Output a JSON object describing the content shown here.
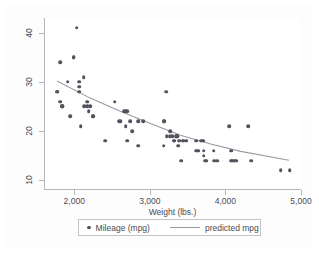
{
  "chart_data": {
    "type": "scatter",
    "title": "",
    "xlabel": "Weight (lbs.)",
    "ylabel": "",
    "xlim": [
      1600,
      5000
    ],
    "ylim": [
      8,
      43
    ],
    "xticks": [
      2000,
      3000,
      4000,
      5000
    ],
    "xticklabels": [
      "2,000",
      "3,000",
      "4,000",
      "5,000"
    ],
    "yticks": [
      10,
      20,
      30,
      40
    ],
    "yticklabels": [
      "10",
      "20",
      "30",
      "40"
    ],
    "grid": false,
    "legend_position": "below-axis",
    "series": [
      {
        "name": "Mileage (mpg)",
        "type": "scatter",
        "marker": "circle",
        "color": "#53535f",
        "points": [
          [
            1760,
            28
          ],
          [
            1760,
            28
          ],
          [
            1800,
            34
          ],
          [
            1800,
            26
          ],
          [
            1830,
            25
          ],
          [
            1830,
            25
          ],
          [
            1830,
            25
          ],
          [
            1900,
            30
          ],
          [
            1930,
            23
          ],
          [
            1980,
            35
          ],
          [
            1980,
            35
          ],
          [
            2020,
            41
          ],
          [
            2050,
            30
          ],
          [
            2050,
            29
          ],
          [
            2050,
            28
          ],
          [
            2070,
            21
          ],
          [
            2110,
            31
          ],
          [
            2120,
            25
          ],
          [
            2160,
            26
          ],
          [
            2160,
            25
          ],
          [
            2180,
            24
          ],
          [
            2200,
            25
          ],
          [
            2230,
            23
          ],
          [
            2240,
            23
          ],
          [
            2400,
            18
          ],
          [
            2520,
            26
          ],
          [
            2580,
            22
          ],
          [
            2600,
            22
          ],
          [
            2650,
            24
          ],
          [
            2670,
            24
          ],
          [
            2690,
            24
          ],
          [
            2690,
            18
          ],
          [
            2670,
            21
          ],
          [
            2730,
            22
          ],
          [
            2750,
            20
          ],
          [
            2830,
            17
          ],
          [
            2830,
            22
          ],
          [
            2900,
            22
          ],
          [
            3170,
            22
          ],
          [
            3180,
            22
          ],
          [
            3170,
            17
          ],
          [
            3200,
            28
          ],
          [
            3210,
            19
          ],
          [
            3250,
            19
          ],
          [
            3260,
            20
          ],
          [
            3280,
            19
          ],
          [
            3300,
            18
          ],
          [
            3310,
            18
          ],
          [
            3330,
            19
          ],
          [
            3350,
            19
          ],
          [
            3350,
            19
          ],
          [
            3360,
            17
          ],
          [
            3370,
            18
          ],
          [
            3380,
            18
          ],
          [
            3400,
            14
          ],
          [
            3420,
            18
          ],
          [
            3430,
            18
          ],
          [
            3470,
            18
          ],
          [
            3600,
            16
          ],
          [
            3600,
            18
          ],
          [
            3630,
            16
          ],
          [
            3670,
            18
          ],
          [
            3690,
            18
          ],
          [
            3700,
            16
          ],
          [
            3700,
            15
          ],
          [
            3720,
            14
          ],
          [
            3730,
            14
          ],
          [
            3830,
            16
          ],
          [
            3840,
            14
          ],
          [
            3880,
            14
          ],
          [
            4040,
            21
          ],
          [
            4060,
            16
          ],
          [
            4060,
            14
          ],
          [
            4080,
            14
          ],
          [
            4100,
            14
          ],
          [
            4130,
            14
          ],
          [
            4290,
            21
          ],
          [
            4330,
            14
          ],
          [
            4720,
            12
          ],
          [
            4840,
            12
          ]
        ]
      },
      {
        "name": "predicted mpg",
        "type": "line",
        "color": "#9a9aa3",
        "points": [
          [
            1760,
            30.1
          ],
          [
            2200,
            26.6
          ],
          [
            2600,
            23.9
          ],
          [
            3000,
            21.4
          ],
          [
            3400,
            19.0
          ],
          [
            3800,
            17.2
          ],
          [
            4200,
            15.7
          ],
          [
            4840,
            13.9
          ]
        ]
      }
    ]
  },
  "legend": {
    "entries": [
      {
        "label": "Mileage (mpg)",
        "marker": "point-marker-icon"
      },
      {
        "label": "predicted mpg",
        "marker": "line-marker-icon"
      }
    ]
  }
}
